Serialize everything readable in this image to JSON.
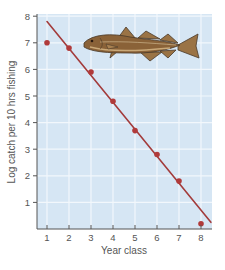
{
  "chart_data": {
    "type": "scatter",
    "title": "",
    "xlabel": "Year class",
    "ylabel": "Log catch per 10 hrs fishing",
    "xlim": [
      0.55,
      8.5
    ],
    "ylim": [
      0,
      8
    ],
    "x_ticks": [
      1,
      2,
      3,
      4,
      5,
      6,
      7,
      8
    ],
    "y_ticks": [
      1,
      2,
      3,
      4,
      5,
      6,
      7,
      8
    ],
    "grid": true,
    "legend": null,
    "series": [
      {
        "name": "Observed catch",
        "kind": "points",
        "x": [
          1,
          2,
          3,
          4,
          5,
          6,
          7,
          8
        ],
        "y": [
          7.0,
          6.8,
          5.9,
          4.8,
          3.7,
          2.8,
          1.8,
          0.2
        ]
      },
      {
        "name": "Fitted line",
        "kind": "line",
        "x": [
          1,
          8.45
        ],
        "y": [
          7.8,
          0.25
        ]
      }
    ],
    "annotations": [
      "fish illustration (haddock/cod) in upper right of plot"
    ]
  },
  "colors": {
    "plot_background": "#d6e6f4",
    "grid": "#f2f7fc",
    "axis": "#555555",
    "data": "#b03a3a",
    "line": "#a33b3b"
  },
  "labels": {
    "xlabel": "Year class",
    "ylabel": "Log catch per 10 hrs fishing",
    "x_ticks": [
      "1",
      "2",
      "3",
      "4",
      "5",
      "6",
      "7",
      "8"
    ],
    "y_ticks": [
      "1",
      "2",
      "3",
      "4",
      "5",
      "6",
      "7",
      "8"
    ]
  }
}
